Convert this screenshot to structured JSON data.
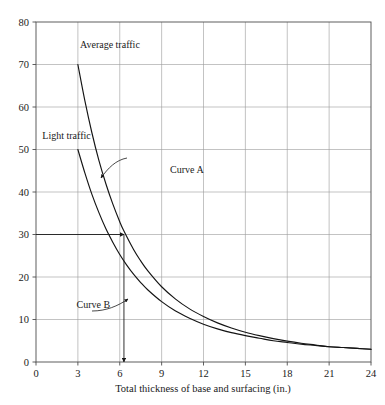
{
  "chart_data": {
    "type": "line",
    "title": "",
    "subtitle": "",
    "xlabel": "Total thickness of base and surfacing (in.)",
    "ylabel": "",
    "xlim": [
      0,
      24
    ],
    "ylim": [
      0,
      80
    ],
    "xticks": [
      0,
      3,
      6,
      9,
      12,
      15,
      18,
      21,
      24
    ],
    "xtick_labels": [
      "0",
      "3",
      "6",
      "9",
      "12",
      "15",
      "18",
      "21",
      "24"
    ],
    "yticks": [
      0,
      10,
      20,
      30,
      40,
      50,
      60,
      70,
      80
    ],
    "ytick_labels": [
      "0",
      "10",
      "20",
      "30",
      "40",
      "50",
      "60",
      "70",
      "80"
    ],
    "grid": true,
    "legend_position": "none",
    "series": [
      {
        "name": "Curve A",
        "label": "Average traffic",
        "color": "#141414",
        "x": [
          3,
          3.5,
          4,
          4.5,
          5,
          5.5,
          6,
          6.3,
          7,
          7.5,
          8,
          9,
          10,
          11,
          12,
          13,
          14,
          15,
          16,
          17,
          18,
          19,
          20,
          21,
          22,
          23,
          24
        ],
        "y": [
          70,
          61.5,
          54,
          47.5,
          42,
          37.2,
          33,
          30.8,
          26.4,
          23.8,
          21.5,
          17.7,
          14.8,
          12.5,
          10.7,
          9.2,
          8.0,
          7.0,
          6.2,
          5.5,
          4.9,
          4.4,
          4.0,
          3.6,
          3.4,
          3.2,
          3.0
        ]
      },
      {
        "name": "Curve B",
        "label": "Light traffic",
        "color": "#141414",
        "x": [
          3,
          3.5,
          4,
          4.5,
          5,
          5.5,
          6,
          6.5,
          7,
          7.5,
          8,
          9,
          10,
          11,
          12,
          13,
          14,
          15,
          16,
          17,
          18,
          19,
          20,
          21,
          22,
          23,
          24
        ],
        "y": [
          50,
          44.5,
          39.5,
          35.2,
          31.4,
          28.2,
          25.3,
          22.8,
          20.6,
          18.7,
          17.0,
          14.2,
          12.0,
          10.3,
          8.9,
          7.8,
          6.9,
          6.2,
          5.6,
          5.0,
          4.6,
          4.2,
          3.9,
          3.6,
          3.4,
          3.2,
          3.0
        ]
      }
    ],
    "annotations": [
      {
        "name": "average-traffic-label",
        "text": "Average traffic",
        "x": 3.15,
        "y": 74.0
      },
      {
        "name": "light-traffic-label",
        "text": "Light traffic",
        "x": 0.45,
        "y": 52.5
      },
      {
        "name": "curve-a-label",
        "text": "Curve A",
        "x": 9.6,
        "y": 44.5
      },
      {
        "name": "curve-b-label",
        "text": "Curve B",
        "x": 2.9,
        "y": 12.8
      }
    ],
    "construction_lines": [
      {
        "name": "design-value-horizontal",
        "from": [
          0,
          30
        ],
        "to": [
          6.3,
          30
        ],
        "arrow": "end",
        "value": 30
      },
      {
        "name": "design-thickness-vertical",
        "from": [
          6.3,
          30
        ],
        "to": [
          6.3,
          0
        ],
        "arrow": "end",
        "value": 6.3
      }
    ]
  },
  "figure": {
    "background_color": "#ffffff",
    "curve_color": "#141414",
    "grid_color": "#9a9a9a",
    "frame_color": "#4d4d4d",
    "text_color": "#1a1a1a"
  }
}
